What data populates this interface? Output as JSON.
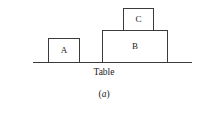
{
  "figure": {
    "caption_open_paren": "(",
    "caption_letter": "a",
    "caption_close_paren": ")",
    "caption_full": "(a)",
    "surface_label": "Table",
    "line_color": "#3a3a3a",
    "fill_color": "#ffffff",
    "background_color": "#ffffff",
    "text_color": "#1a1a1a"
  },
  "blocks": [
    {
      "id": "a",
      "label": "A",
      "x": 48,
      "y": 38,
      "width": 32,
      "height": 25,
      "rests_on": "Table"
    },
    {
      "id": "b",
      "label": "B",
      "x": 102,
      "y": 30,
      "width": 66,
      "height": 33,
      "rests_on": "Table"
    },
    {
      "id": "c",
      "label": "C",
      "x": 123,
      "y": 8,
      "width": 31,
      "height": 23,
      "rests_on": "B"
    }
  ],
  "surface": {
    "x": 33,
    "y": 62,
    "width": 159,
    "thickness": 1
  }
}
